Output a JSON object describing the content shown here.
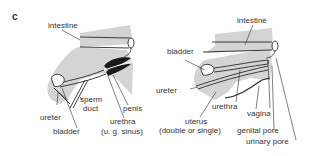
{
  "panel_label": "c",
  "colors": {
    "fill": "#d4d4d4",
    "line": "#2a2a2a",
    "dark": "#1a1a1a",
    "text": "#333333"
  },
  "male": {
    "labels": {
      "intestine": "intestine",
      "sperm_duct_1": "sperm",
      "sperm_duct_2": "duct",
      "penis": "penis",
      "ureter": "ureter",
      "bladder": "bladder",
      "urethra_1": "urethra",
      "urethra_2": "(u. g. sinus)"
    }
  },
  "female": {
    "labels": {
      "intestine": "intestine",
      "bladder": "bladder",
      "ureter": "ureter",
      "urethra": "urethra",
      "vagina": "vagina",
      "uterus_1": "uterus",
      "uterus_2": "(double or single)",
      "genital_pore": "genital pore",
      "urinary_pore": "urinary pore"
    }
  }
}
